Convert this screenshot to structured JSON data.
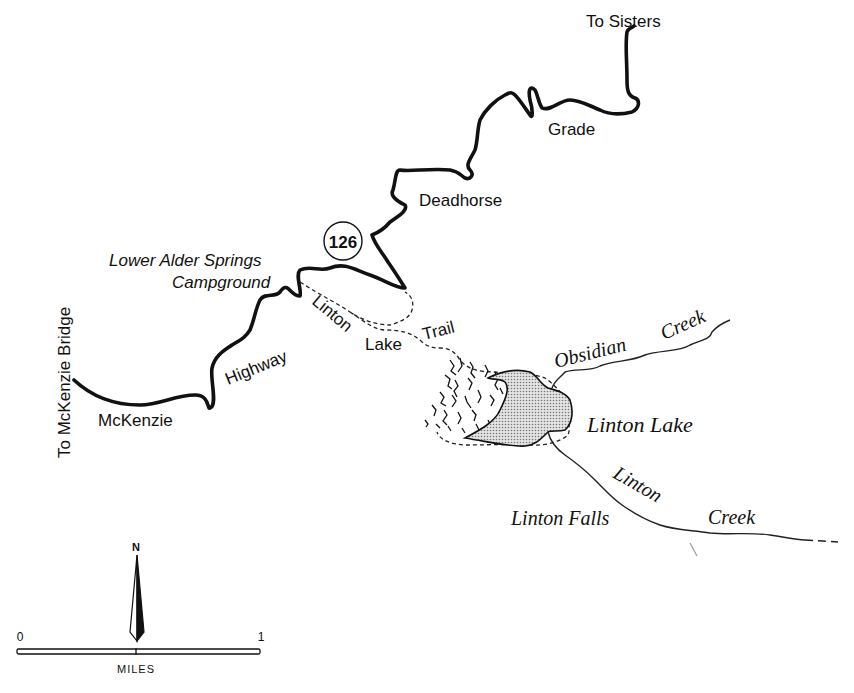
{
  "map": {
    "labels": {
      "to_sisters": "To Sisters",
      "grade": "Grade",
      "deadhorse": "Deadhorse",
      "highway_shield": "126",
      "campground_line1": "Lower Alder Springs",
      "campground_line2": "Campground",
      "to_mckenzie_bridge": "To McKenzie Bridge",
      "highway": "Highway",
      "mckenzie": "McKenzie",
      "trail_word1": "Linton",
      "trail_word2": "Lake",
      "trail_word3": "Trail",
      "obsidian": "Obsidian",
      "obsidian_creek": "Creek",
      "linton_lake": "Linton Lake",
      "linton_creek1": "Linton",
      "linton_creek2": "Creek",
      "linton_falls": "Linton Falls"
    },
    "scale": {
      "start": "0",
      "end": "1",
      "unit": "MILES",
      "north": "N"
    },
    "colors": {
      "ink": "#111111",
      "lake_fill": "#c8c8c8",
      "background": "#ffffff"
    }
  }
}
